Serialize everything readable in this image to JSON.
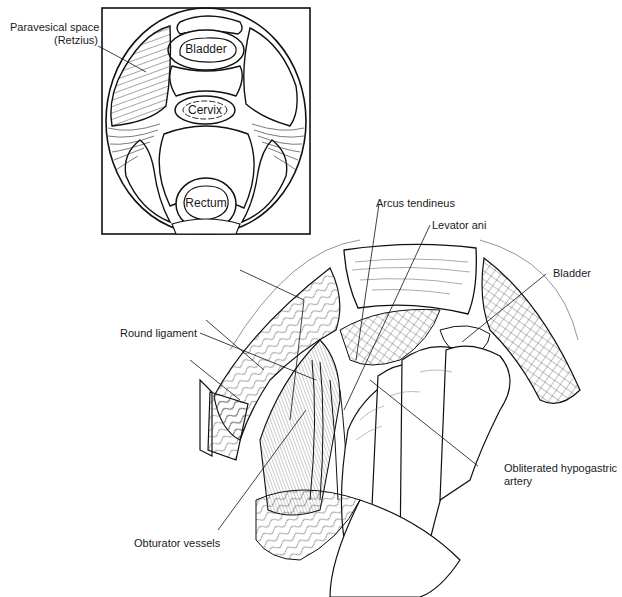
{
  "figure": {
    "type": "anatomical-illustration",
    "inset": {
      "description": "Cross-section schematic of pelvic spaces",
      "callout": {
        "line1": "Paravesical space",
        "line2": "(Retzius)"
      },
      "organs": {
        "bladder": "Bladder",
        "cervix": "Cervix",
        "rectum": "Rectum"
      }
    },
    "main": {
      "description": "Surgical view of paravesical space dissection with hand",
      "labels": {
        "arcus": "Arcus tendineus",
        "levator": "Levator ani",
        "bladder": "Bladder",
        "round_ligament": "Round ligament",
        "hypogastric_line1": "Obliterated hypogastric",
        "hypogastric_line2": "artery",
        "obturator": "Obturator vessels"
      }
    }
  }
}
